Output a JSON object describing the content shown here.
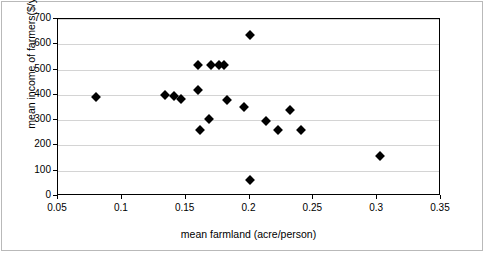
{
  "chart_data": {
    "type": "scatter",
    "title": "",
    "xlabel": "mean farmland (acre/person)",
    "ylabel": "mean income of farmers($/year)",
    "xlim": [
      0.05,
      0.35
    ],
    "ylim": [
      0,
      700
    ],
    "xticks": [
      "0.05",
      "0.1",
      "0.15",
      "0.2",
      "0.25",
      "0.3",
      "0.35"
    ],
    "xtick_values": [
      0.05,
      0.1,
      0.15,
      0.2,
      0.25,
      0.3,
      0.35
    ],
    "yticks": [
      "0",
      "100",
      "200",
      "300",
      "400",
      "500",
      "600",
      "700"
    ],
    "ytick_values": [
      0,
      100,
      200,
      300,
      400,
      500,
      600,
      700
    ],
    "grid": "horizontal",
    "legend": "none",
    "marker": "diamond",
    "marker_color": "#000000",
    "series": [
      {
        "name": "farmers",
        "points": [
          {
            "x": 0.08,
            "y": 390
          },
          {
            "x": 0.134,
            "y": 398
          },
          {
            "x": 0.141,
            "y": 396
          },
          {
            "x": 0.146,
            "y": 385
          },
          {
            "x": 0.16,
            "y": 520
          },
          {
            "x": 0.16,
            "y": 418
          },
          {
            "x": 0.161,
            "y": 262
          },
          {
            "x": 0.168,
            "y": 303
          },
          {
            "x": 0.17,
            "y": 520
          },
          {
            "x": 0.176,
            "y": 520
          },
          {
            "x": 0.18,
            "y": 518
          },
          {
            "x": 0.182,
            "y": 378
          },
          {
            "x": 0.196,
            "y": 352
          },
          {
            "x": 0.2,
            "y": 638
          },
          {
            "x": 0.2,
            "y": 62
          },
          {
            "x": 0.213,
            "y": 297
          },
          {
            "x": 0.222,
            "y": 260
          },
          {
            "x": 0.232,
            "y": 340
          },
          {
            "x": 0.24,
            "y": 262
          },
          {
            "x": 0.302,
            "y": 158
          }
        ]
      }
    ]
  }
}
